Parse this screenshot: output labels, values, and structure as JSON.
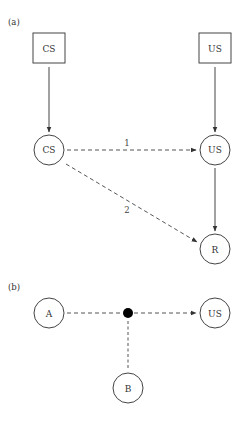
{
  "panels": {
    "a": {
      "label": "(a)",
      "nodes": {
        "cs_box": {
          "label": "CS",
          "shape": "square"
        },
        "us_box": {
          "label": "US",
          "shape": "square"
        },
        "cs_circle": {
          "label": "CS",
          "shape": "circle"
        },
        "us_circle": {
          "label": "US",
          "shape": "circle"
        },
        "r_circle": {
          "label": "R",
          "shape": "circle"
        }
      },
      "edges": [
        {
          "from": "CS (square)",
          "to": "CS (circle)",
          "style": "solid",
          "label": ""
        },
        {
          "from": "US (square)",
          "to": "US (circle)",
          "style": "solid",
          "label": ""
        },
        {
          "from": "CS (circle)",
          "to": "US (circle)",
          "style": "dashed",
          "label": "1"
        },
        {
          "from": "CS (circle)",
          "to": "R",
          "style": "dashed",
          "label": "2"
        },
        {
          "from": "US (circle)",
          "to": "R",
          "style": "solid",
          "label": ""
        }
      ],
      "edge_labels": {
        "one": "1",
        "two": "2"
      }
    },
    "b": {
      "label": "(b)",
      "nodes": {
        "a_circle": {
          "label": "A",
          "shape": "circle"
        },
        "us_circle": {
          "label": "US",
          "shape": "circle"
        },
        "b_circle": {
          "label": "B",
          "shape": "circle"
        },
        "junction": {
          "label": "",
          "shape": "filled-dot"
        }
      },
      "edges": [
        {
          "from": "A",
          "to": "junction",
          "style": "dashed"
        },
        {
          "from": "B",
          "to": "junction",
          "style": "dashed"
        },
        {
          "from": "junction",
          "to": "US",
          "style": "dashed"
        }
      ]
    }
  },
  "colors": {
    "stroke": "#444444",
    "text": "#333333",
    "junction": "#000000",
    "background": "#ffffff"
  }
}
